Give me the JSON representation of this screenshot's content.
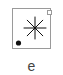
{
  "diagram": {
    "panel_label": "e",
    "elements": [
      {
        "type": "frame",
        "shape": "square",
        "color": "#9a9a9a"
      },
      {
        "type": "star",
        "points": 8,
        "color": "#111111",
        "position": "center"
      },
      {
        "type": "dot",
        "filled": true,
        "color": "#111111",
        "position": "lower-left"
      },
      {
        "type": "square",
        "filled": false,
        "color": "#9a9a9a",
        "position": "upper-right"
      }
    ]
  }
}
